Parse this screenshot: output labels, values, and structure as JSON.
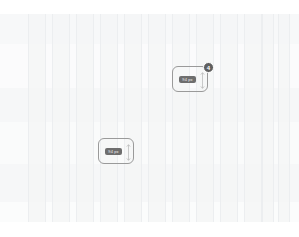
{
  "canvas": {
    "width": 299,
    "height": 237,
    "background": "#ffffff",
    "name": "design-canvas"
  },
  "grid_overlay": {
    "name": "responsive-grid-overlay",
    "column_count": 12,
    "column_color": "#f4f5f6",
    "column_line_color": "#eceef0",
    "gutter_color": "#ffffff",
    "left_margin": 28,
    "right_margin": 28,
    "top": 14,
    "bottom": 222,
    "columns": [
      {
        "x": 28,
        "width": 18
      },
      {
        "x": 52,
        "width": 18
      },
      {
        "x": 76,
        "width": 18
      },
      {
        "x": 100,
        "width": 18
      },
      {
        "x": 124,
        "width": 18
      },
      {
        "x": 148,
        "width": 18
      },
      {
        "x": 172,
        "width": 18
      },
      {
        "x": 196,
        "width": 18
      },
      {
        "x": 220,
        "width": 18
      },
      {
        "x": 244,
        "width": 18
      },
      {
        "x": 262,
        "width": 12
      },
      {
        "x": 278,
        "width": 12
      }
    ],
    "bands": [
      {
        "top": 14,
        "height": 30,
        "color": "#f7f8f9"
      },
      {
        "top": 44,
        "height": 44,
        "color": "#fbfbfc"
      },
      {
        "top": 88,
        "height": 34,
        "color": "#f6f7f8"
      },
      {
        "top": 122,
        "height": 42,
        "color": "#fafbfb"
      },
      {
        "top": 164,
        "height": 38,
        "color": "#f6f7f8"
      },
      {
        "top": 202,
        "height": 20,
        "color": "#fbfcfc"
      }
    ]
  },
  "selections": [
    {
      "id": "selection-upper",
      "name": "element-selection-upper",
      "x": 172,
      "y": 66,
      "width": 36,
      "height": 26,
      "border_color": "#9a9a9a",
      "label": {
        "name": "dimension-label",
        "text": "94 px",
        "x": 6,
        "y": 9,
        "width": 17,
        "height": 7,
        "background": "#6e6e6e",
        "color": "#f2f2f2"
      },
      "height_arrow": {
        "name": "height-measure-arrow",
        "x": 26,
        "y": 5,
        "height": 17,
        "color": "#b4b4b4"
      },
      "badge": {
        "name": "selection-index-badge",
        "text": "4",
        "x": 30,
        "y": -5,
        "background": "#5f5f5f",
        "color": "#ffffff"
      }
    },
    {
      "id": "selection-lower",
      "name": "element-selection-lower",
      "x": 98,
      "y": 138,
      "width": 36,
      "height": 26,
      "border_color": "#9a9a9a",
      "label": {
        "name": "dimension-label",
        "text": "94 px",
        "x": 6,
        "y": 9,
        "width": 17,
        "height": 7,
        "background": "#6e6e6e",
        "color": "#f2f2f2"
      },
      "height_arrow": {
        "name": "height-measure-arrow",
        "x": 26,
        "y": 5,
        "height": 17,
        "color": "#b4b4b4"
      },
      "badge": null
    }
  ]
}
